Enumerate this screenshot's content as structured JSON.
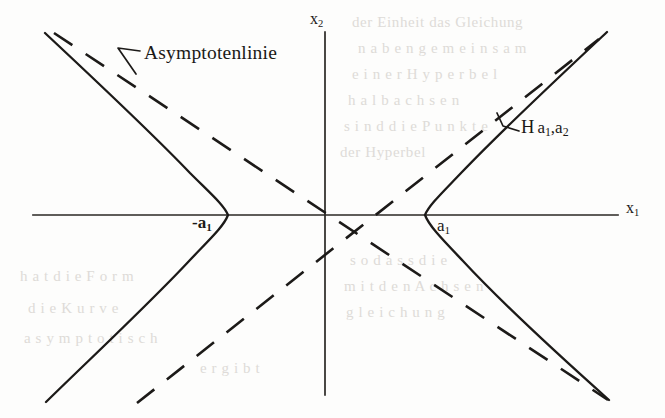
{
  "figure": {
    "kind": "hyperbola-with-asymptotes-diagram",
    "background_color": "#fdfdfc",
    "ink_color": "#1c1a18",
    "axes": {
      "horizontal": {
        "label": "x",
        "subscript": "1",
        "x_start": 33,
        "x_end": 618,
        "y": 215
      },
      "vertical": {
        "label": "x",
        "subscript": "2",
        "y_start": 32,
        "y_end": 395,
        "x": 325
      }
    },
    "origin": {
      "x": 325,
      "y": 215
    },
    "vertices": {
      "right": {
        "label": "a",
        "subscript": "1",
        "x": 425,
        "y": 215
      },
      "left": {
        "label": "-a",
        "subscript": "1",
        "x": 228,
        "y": 215
      }
    },
    "annotations": {
      "asymptote_label": "Asymptotenlinie",
      "hyperbola_label_main": "H",
      "hyperbola_label_params": "a₁,a₂"
    }
  },
  "labels": {
    "asymptotenlinie": "Asymptotenlinie",
    "hyperbola_h": "H",
    "hyperbola_a": "a",
    "hyperbola_sub1": "1",
    "hyperbola_comma_a": ",a",
    "hyperbola_sub2": "2",
    "a1_main": "a",
    "a1_sub": "1",
    "neg_a1_main": "-a",
    "neg_a1_sub": "1",
    "x1_main": "x",
    "x1_sub": "1",
    "x2_main": "x",
    "x2_sub": "2"
  },
  "bleed_text": {
    "lines": [
      {
        "text": "der Einheit das Gleichung",
        "x": 352,
        "y": 14
      },
      {
        "text": "n  a  b  e n  g e m  e i n s a m",
        "x": 358,
        "y": 40
      },
      {
        "text": "e i n e r   H y p e r b e l",
        "x": 352,
        "y": 66
      },
      {
        "text": "h a l b a c h s e n",
        "x": 348,
        "y": 92
      },
      {
        "text": "s i n d   d i e   P u n k t e",
        "x": 344,
        "y": 118
      },
      {
        "text": "der Hyperbel",
        "x": 340,
        "y": 144
      },
      {
        "text": "s o   d a s s   d i e",
        "x": 350,
        "y": 252
      },
      {
        "text": "m  i t   d e n   A  c h  s e n",
        "x": 344,
        "y": 278
      },
      {
        "text": "g l e i c h u n g",
        "x": 346,
        "y": 304
      },
      {
        "text": "h a t   d i e   F  o  r  m",
        "x": 20,
        "y": 268
      },
      {
        "text": "d i e   K u r v e",
        "x": 28,
        "y": 300
      },
      {
        "text": "a s y m p t o t i s c h",
        "x": 24,
        "y": 330
      },
      {
        "text": "e  r  g  i  b  t",
        "x": 200,
        "y": 360
      }
    ]
  }
}
